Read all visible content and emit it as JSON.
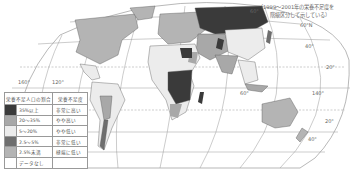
{
  "note": {
    "line1": "（1999～2001年の栄養不足度を",
    "line2": "階級区分して示している）"
  },
  "legend": {
    "header_ratio": "栄養不足人口の割合",
    "header_level": "栄養不足度",
    "rows": [
      {
        "ratio": "35%以上",
        "level": "非常に高い",
        "color": "#3a3a3a"
      },
      {
        "ratio": "20～35%",
        "level": "やや高い",
        "color": "#a8a8a8"
      },
      {
        "ratio": "5～20%",
        "level": "やや低い",
        "color": "#ececec"
      },
      {
        "ratio": "2.5～5%",
        "level": "非常に低い",
        "color": "#6e6e6e"
      },
      {
        "ratio": "2.5%未満",
        "level": "極端に低い",
        "color": "#b4b4b4"
      },
      {
        "ratio": "データなし",
        "level": "",
        "color": "#ffffff"
      }
    ]
  },
  "graticule_labels": {
    "lon_160": "160°",
    "lon_120": "120°",
    "top_60": "60°",
    "lat_60n": "60°N",
    "lat_40": "40°",
    "lat_20": "20°",
    "lon_60e": "60°",
    "lon_140e": "140°",
    "lat_20s": "20°",
    "lat_40s": "40°"
  }
}
